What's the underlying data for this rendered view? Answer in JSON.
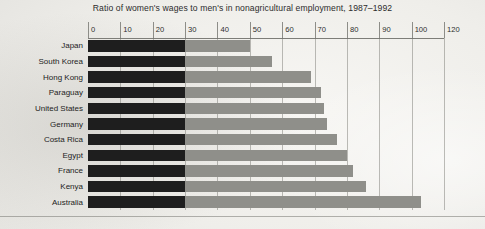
{
  "chart": {
    "title": "Ratio of women's wages to men's in nonagricultural employment, 1987–1992",
    "axis_labels": [
      "0",
      "10",
      "20",
      "30",
      "40",
      "50",
      "60",
      "70",
      "80",
      "90",
      "100",
      "120"
    ],
    "axis_values": [
      0,
      10,
      20,
      30,
      40,
      50,
      60,
      70,
      80,
      90,
      100,
      110
    ],
    "colors": {
      "bar_light": "#8f8f8a",
      "bar_dark": "#1e1e1e",
      "background": "#efeeea",
      "gridline": "#6e6e69",
      "text": "#232323"
    }
  },
  "chart_data": {
    "type": "bar",
    "orientation": "horizontal",
    "title": "Ratio of women's wages to men's in nonagricultural employment, 1987–1992",
    "xlabel": "",
    "ylabel": "",
    "xlim": [
      0,
      110
    ],
    "grid": true,
    "legend": "none",
    "xticklabels": [
      "0",
      "10",
      "20",
      "30",
      "40",
      "50",
      "60",
      "70",
      "80",
      "90",
      "100",
      "120"
    ],
    "xtickvalues": [
      0,
      10,
      20,
      30,
      40,
      50,
      60,
      70,
      80,
      90,
      100,
      110
    ],
    "categories": [
      "Japan",
      "South Korea",
      "Hong Kong",
      "Paraguay",
      "United States",
      "Germany",
      "Costa Rica",
      "Egypt",
      "France",
      "Kenya",
      "Australia"
    ],
    "values": [
      50,
      57,
      69,
      72,
      73,
      74,
      77,
      80,
      82,
      86,
      103
    ],
    "annotations": [
      "Bars are shaded dark from 0 to 30 and light gray beyond 30"
    ]
  }
}
